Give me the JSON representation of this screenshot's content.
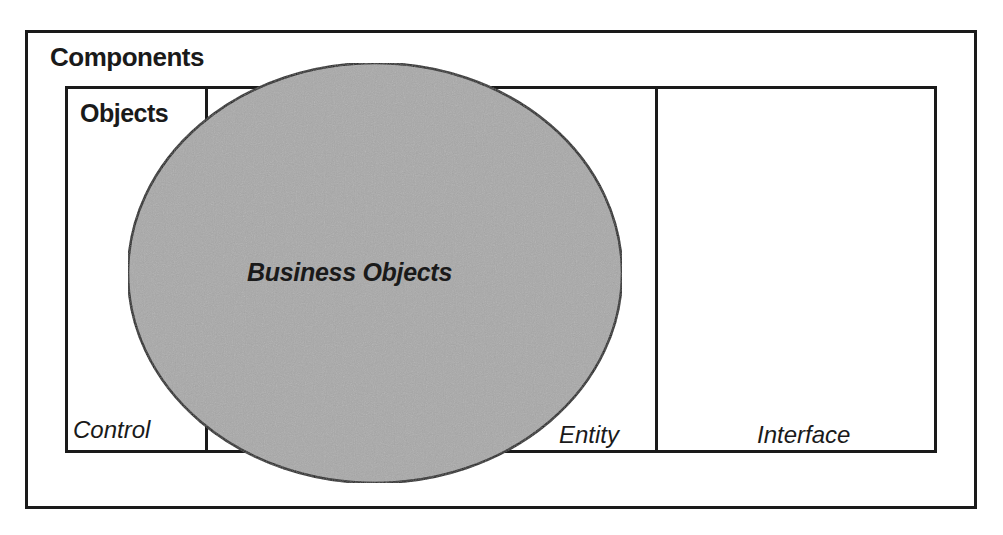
{
  "diagram": {
    "outer_container": {
      "label": "Components"
    },
    "inner_container": {
      "label": "Objects",
      "sections": [
        {
          "label": "Control"
        },
        {
          "label": "Entity"
        },
        {
          "label": "Interface"
        }
      ]
    },
    "overlay": {
      "label": "Business Objects",
      "shape": "ellipse",
      "fill_color": "#a9a9a9",
      "stroke_color": "#1a1a1a"
    },
    "colors": {
      "line": "#1a1a1a",
      "background": "#ffffff"
    }
  }
}
